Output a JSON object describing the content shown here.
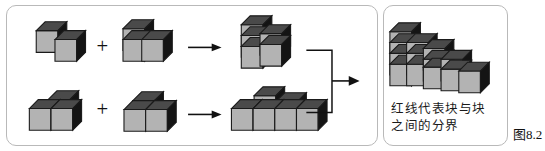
{
  "figure": {
    "number_label": "图8.2",
    "caption": "红线代表块与块\n之间的分界",
    "caption_lines": [
      "红线代表块与块",
      "之间的分界"
    ],
    "operators": {
      "plus": "+",
      "arrow": "→"
    },
    "colors": {
      "cube_front": "#b3b3b3",
      "cube_top": "#4a4a4a",
      "cube_side": "#141414",
      "outline": "#1a1a1a",
      "panel_border": "#b9b9b9",
      "background": "#ffffff",
      "text": "#1a1a1a"
    },
    "rows": [
      {
        "name": "row-1",
        "operand_a": {
          "name": "two-cube-diagonal-piece",
          "cube_count": 2
        },
        "operand_b": {
          "name": "three-cube-piece",
          "cube_count": 3
        },
        "result": {
          "name": "combined-block-upper",
          "cube_count": 5
        }
      },
      {
        "name": "row-2",
        "operand_a": {
          "name": "three-cube-step-piece",
          "cube_count": 3
        },
        "operand_b": {
          "name": "three-cube-flat-piece",
          "cube_count": 3
        },
        "result": {
          "name": "combined-block-lower",
          "cube_count": 6
        }
      }
    ],
    "final": {
      "name": "staircase-assembly",
      "column_heights": [
        4,
        3,
        3,
        2,
        1
      ],
      "column_count": 5
    }
  }
}
